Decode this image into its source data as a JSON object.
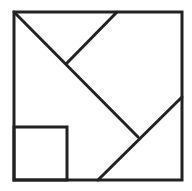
{
  "diagram": {
    "type": "tangram-square-dissection",
    "stroke_color": "#222222",
    "background": "#ffffff",
    "stroke_width": 3,
    "outer_square": {
      "x1": 14,
      "y1": 12,
      "x2": 182,
      "y2": 180
    },
    "small_square": {
      "x1": 14,
      "y1": 127,
      "x2": 67,
      "y2": 180
    },
    "segments": [
      {
        "name": "main-diagonal",
        "x1": 14,
        "y1": 12,
        "x2": 138,
        "y2": 137
      },
      {
        "name": "upper-diagonal",
        "x1": 117,
        "y1": 12,
        "x2": 67,
        "y2": 63
      },
      {
        "name": "lower-right-diagonal",
        "x1": 182,
        "y1": 97,
        "x2": 98,
        "y2": 180
      }
    ]
  }
}
